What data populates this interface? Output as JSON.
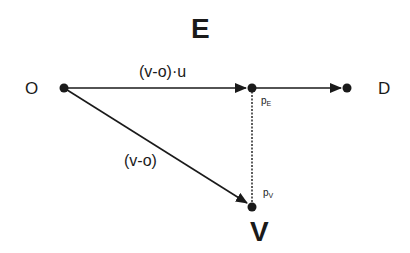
{
  "diagram": {
    "title_top": "E",
    "title_bottom": "V",
    "points": {
      "origin": {
        "label": "O",
        "x": 64,
        "y": 88
      },
      "projection_e": {
        "label": "p",
        "subscript": "E",
        "x": 252,
        "y": 88
      },
      "destination": {
        "label": "D",
        "x": 347,
        "y": 88
      },
      "projection_v": {
        "label": "p",
        "subscript": "V",
        "x": 252,
        "y": 207
      }
    },
    "edges": [
      {
        "from": "O",
        "to": "p_E",
        "label": "(v-o)·u",
        "style": "solid-arrow"
      },
      {
        "from": "p_E",
        "to": "D",
        "label": "",
        "style": "solid-arrow"
      },
      {
        "from": "O",
        "to": "p_V",
        "label": "(v-o)",
        "style": "solid-arrow"
      },
      {
        "from": "p_E",
        "to": "p_V",
        "label": "",
        "style": "dashed"
      }
    ],
    "edge_labels": {
      "projection": "(v-o)·u",
      "vector": "(v-o)"
    },
    "colors": {
      "line": "#1a1a1a",
      "background": "#ffffff"
    }
  }
}
